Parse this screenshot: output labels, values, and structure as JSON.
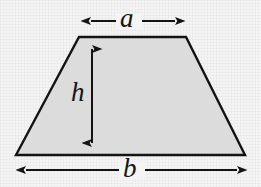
{
  "figure": {
    "shape": "trapezoid",
    "labels": {
      "top_side": "a",
      "height": "h",
      "bottom_side": "b"
    },
    "icons": {
      "top_dimension": "double-arrow-horizontal-icon",
      "height_dimension": "double-arrow-vertical-icon",
      "bottom_dimension": "double-arrow-horizontal-icon"
    },
    "colors": {
      "background": "#f4f4f4",
      "fill": "#dcdcdc",
      "stroke": "#141414",
      "label": "#141414"
    },
    "geometry": {
      "top_left": [
        79,
        37
      ],
      "top_right": [
        186,
        37
      ],
      "bottom_right": [
        245,
        155
      ],
      "bottom_left": [
        16,
        155
      ],
      "stroke_width": 2.4
    },
    "dimensions": {
      "a": {
        "x1": 80,
        "x2": 186,
        "y": 21
      },
      "h": {
        "x": 92,
        "y1": 38,
        "y2": 154
      },
      "b": {
        "x1": 15,
        "x2": 248,
        "y": 170
      }
    }
  }
}
